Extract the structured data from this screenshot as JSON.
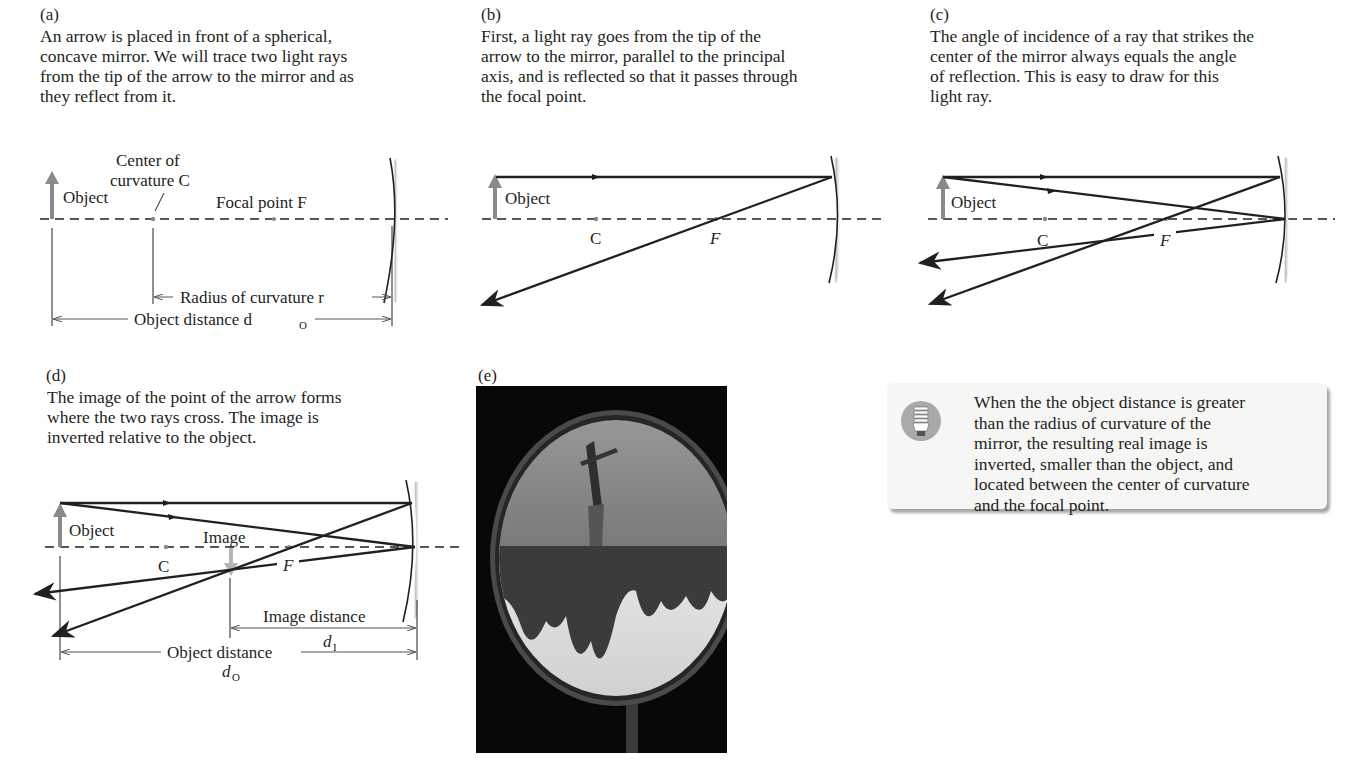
{
  "panels": {
    "a": {
      "label": "(a)",
      "caption": "An arrow is placed in front of a spherical,\nconcave mirror. We will trace two light rays\nfrom the tip of the arrow to the mirror and as\nthey reflect from it.",
      "labels": {
        "object": "Object",
        "center_line1": "Center of",
        "center_line2": "curvature C",
        "focal": "Focal point F",
        "radius": "Radius of curvature r",
        "object_distance": "Object distance d",
        "object_distance_sub": "O"
      }
    },
    "b": {
      "label": "(b)",
      "caption": "First, a light ray goes from the tip of the\narrow to the mirror, parallel to the principal\naxis, and is reflected so that it passes through\nthe focal point.",
      "labels": {
        "object": "Object",
        "c": "C",
        "f": "F"
      }
    },
    "c": {
      "label": "(c)",
      "caption": "The angle of incidence of a ray that strikes the\ncenter of the mirror always equals the angle\nof reflection. This is easy to draw for this\nlight ray.",
      "labels": {
        "object": "Object",
        "c": "C",
        "f": "F"
      }
    },
    "d": {
      "label": "(d)",
      "caption": "The image of the point of the arrow forms\nwhere the two rays cross. The image is\ninverted relative to the object.",
      "labels": {
        "object": "Object",
        "image": "Image",
        "c": "C",
        "f": "F",
        "image_distance": "Image distance",
        "image_distance_symbol": "d",
        "image_distance_sub": "I",
        "object_distance": "Object distance",
        "object_distance_symbol": "d",
        "object_distance_sub": "O"
      }
    },
    "e": {
      "label": "(e)",
      "photo_description": "Concave mirror showing inverted image of trees, sky and a person"
    }
  },
  "callout": {
    "icon": "lightbulb-icon",
    "text": "When the the object distance is greater\nthan the radius of curvature of the\nmirror, the resulting real image is\ninverted, smaller than the object, and\nlocated between the center of curvature\nand the focal point."
  },
  "colors": {
    "ink": "#231f20",
    "object_arrow": "#8a8a8a",
    "image_arrow": "#b5b5b5",
    "callout_bg": "#f6f6f4",
    "icon_bg": "#a9a9a9"
  }
}
